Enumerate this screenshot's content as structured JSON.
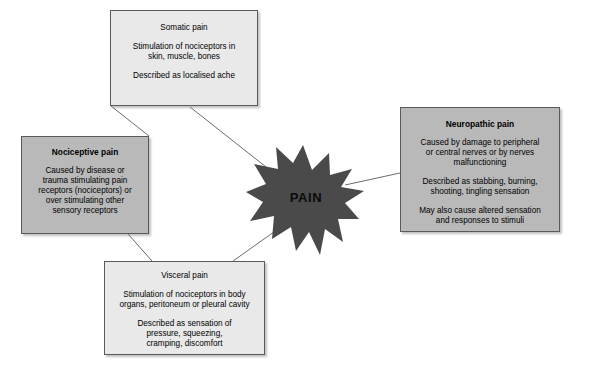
{
  "diagram": {
    "center": {
      "label": "PAIN",
      "shape": "starburst",
      "fill": "#4a4a4a"
    },
    "nodes": [
      {
        "id": "somatic",
        "title": "Somatic pain",
        "style": "light",
        "fill": "#e9e9e9",
        "lines": [
          "Stimulation of nociceptors in\nskin, muscle, bones",
          "Described as localised ache"
        ]
      },
      {
        "id": "nociceptive",
        "title": "Nociceptive pain",
        "style": "dark",
        "fill": "#b9b9b9",
        "lines": [
          "Caused by disease or\ntrauma stimulating pain\nreceptors (nociceptors) or\nover stimulating other\nsensory receptors"
        ]
      },
      {
        "id": "neuropathic",
        "title": "Neuropathic pain",
        "style": "dark",
        "fill": "#b9b9b9",
        "lines": [
          "Caused by damage to peripheral\nor central nerves or by nerves\nmalfunctioning",
          "Described as stabbing, burning,\nshooting, tingling sensation",
          "May also cause altered sensation\nand responses to stimuli"
        ]
      },
      {
        "id": "visceral",
        "title": "Visceral pain",
        "style": "light",
        "fill": "#e9e9e9",
        "lines": [
          "Stimulation of nociceptors in body\norgans, peritoneum or pleural cavity",
          "Described as sensation of\npressure, squeezing,\ncramping, discomfort"
        ]
      }
    ],
    "connectors": [
      {
        "from": "somatic",
        "to": "nociceptive"
      },
      {
        "from": "somatic",
        "to": "center"
      },
      {
        "from": "nociceptive",
        "to": "visceral"
      },
      {
        "from": "visceral",
        "to": "center"
      },
      {
        "from": "center",
        "to": "neuropathic"
      }
    ]
  }
}
